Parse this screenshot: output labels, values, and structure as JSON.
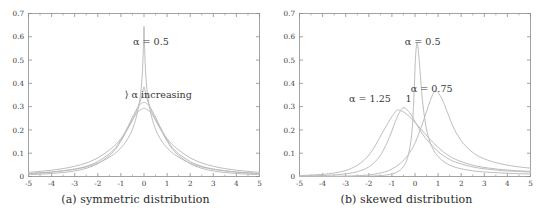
{
  "figure": {
    "background": "#ffffff",
    "curve_color": "#b9b9b9",
    "axis_color": "#8c8c8c",
    "text_color": "#3a3a3a"
  },
  "panels": [
    {
      "id": "a",
      "caption": "(a) symmetric distribution",
      "annotations": [
        {
          "name": "alpha-half-label",
          "text": "α = 0.5",
          "x": 0.3,
          "y": 0.565
        },
        {
          "name": "alpha-increasing-label",
          "text": "⟩ α increasing",
          "x": 0.62,
          "y": 0.335
        }
      ]
    },
    {
      "id": "b",
      "caption": "(b) skewed distribution",
      "annotations": [
        {
          "name": "alpha-0-5-label",
          "text": "α = 0.5",
          "x": 0.33,
          "y": 0.565
        },
        {
          "name": "alpha-0-75-label",
          "text": "α = 0.75",
          "x": 0.72,
          "y": 0.365
        },
        {
          "name": "alpha-1-25-label",
          "text": "α = 1.25",
          "x": -1.95,
          "y": 0.318
        },
        {
          "name": "alpha-1-label",
          "text": "1",
          "x": -0.28,
          "y": 0.318
        }
      ]
    }
  ],
  "chart_data": [
    {
      "type": "line",
      "panel": "a",
      "title": "(a) symmetric distribution",
      "xlabel": "",
      "ylabel": "",
      "xlim": [
        -5,
        5
      ],
      "ylim": [
        0,
        0.7
      ],
      "xticks": [
        -5,
        -4,
        -3,
        -2,
        -1,
        0,
        1,
        2,
        3,
        4,
        5
      ],
      "yticks": [
        0,
        0.1,
        0.2,
        0.3,
        0.4,
        0.5,
        0.6,
        0.7
      ],
      "grid": false,
      "legend": "none",
      "annotations": [
        "α = 0.5",
        "α increasing"
      ],
      "series": [
        {
          "name": "alpha = 0.5",
          "alpha": 0.5,
          "beta": 0,
          "peak_x": 0,
          "peak_y": 0.645,
          "x": [
            -5,
            -4.5,
            -4,
            -3.5,
            -3,
            -2.5,
            -2,
            -1.5,
            -1.2,
            -1,
            -0.8,
            -0.6,
            -0.45,
            -0.3,
            -0.2,
            -0.12,
            -0.06,
            -0.02,
            0,
            0.02,
            0.06,
            0.12,
            0.2,
            0.3,
            0.45,
            0.6,
            0.8,
            1,
            1.2,
            1.5,
            2,
            2.5,
            3,
            3.5,
            4,
            4.5,
            5
          ],
          "y": [
            0.013,
            0.016,
            0.019,
            0.024,
            0.031,
            0.041,
            0.057,
            0.083,
            0.104,
            0.123,
            0.147,
            0.181,
            0.216,
            0.268,
            0.318,
            0.379,
            0.465,
            0.575,
            0.645,
            0.575,
            0.465,
            0.379,
            0.318,
            0.268,
            0.216,
            0.181,
            0.147,
            0.123,
            0.104,
            0.083,
            0.057,
            0.041,
            0.031,
            0.024,
            0.019,
            0.016,
            0.013
          ]
        },
        {
          "name": "alpha = 0.75",
          "alpha": 0.75,
          "beta": 0,
          "peak_x": 0,
          "peak_y": 0.385,
          "x": [
            -5,
            -4.5,
            -4,
            -3.5,
            -3,
            -2.5,
            -2,
            -1.5,
            -1.2,
            -1,
            -0.8,
            -0.6,
            -0.45,
            -0.3,
            -0.2,
            -0.12,
            -0.06,
            -0.02,
            0,
            0.02,
            0.06,
            0.12,
            0.2,
            0.3,
            0.45,
            0.6,
            0.8,
            1,
            1.2,
            1.5,
            2,
            2.5,
            3,
            3.5,
            4,
            4.5,
            5
          ],
          "y": [
            0.018,
            0.022,
            0.027,
            0.034,
            0.044,
            0.058,
            0.08,
            0.114,
            0.14,
            0.163,
            0.19,
            0.223,
            0.252,
            0.288,
            0.313,
            0.337,
            0.362,
            0.38,
            0.385,
            0.38,
            0.362,
            0.337,
            0.313,
            0.288,
            0.252,
            0.223,
            0.19,
            0.163,
            0.14,
            0.114,
            0.08,
            0.058,
            0.044,
            0.034,
            0.027,
            0.022,
            0.018
          ]
        },
        {
          "name": "alpha = 1.0",
          "alpha": 1.0,
          "beta": 0,
          "peak_x": 0,
          "peak_y": 0.318,
          "x": [
            -5,
            -4.5,
            -4,
            -3.5,
            -3,
            -2.5,
            -2,
            -1.5,
            -1.2,
            -1,
            -0.8,
            -0.6,
            -0.45,
            -0.3,
            -0.2,
            -0.12,
            -0.06,
            -0.02,
            0,
            0.02,
            0.06,
            0.12,
            0.2,
            0.3,
            0.45,
            0.6,
            0.8,
            1,
            1.2,
            1.5,
            2,
            2.5,
            3,
            3.5,
            4,
            4.5,
            5
          ],
          "y": [
            0.012,
            0.015,
            0.019,
            0.025,
            0.032,
            0.044,
            0.064,
            0.098,
            0.127,
            0.159,
            0.194,
            0.234,
            0.265,
            0.292,
            0.306,
            0.313,
            0.317,
            0.318,
            0.318,
            0.318,
            0.317,
            0.313,
            0.306,
            0.292,
            0.265,
            0.234,
            0.194,
            0.159,
            0.127,
            0.098,
            0.064,
            0.044,
            0.032,
            0.025,
            0.019,
            0.015,
            0.012
          ]
        },
        {
          "name": "alpha = 1.25",
          "alpha": 1.25,
          "beta": 0,
          "peak_x": 0,
          "peak_y": 0.293,
          "x": [
            -5,
            -4.5,
            -4,
            -3.5,
            -3,
            -2.5,
            -2,
            -1.5,
            -1.2,
            -1,
            -0.8,
            -0.6,
            -0.45,
            -0.3,
            -0.2,
            -0.12,
            -0.06,
            -0.02,
            0,
            0.02,
            0.06,
            0.12,
            0.2,
            0.3,
            0.45,
            0.6,
            0.8,
            1,
            1.2,
            1.5,
            2,
            2.5,
            3,
            3.5,
            4,
            4.5,
            5
          ],
          "y": [
            0.008,
            0.01,
            0.013,
            0.017,
            0.024,
            0.035,
            0.055,
            0.09,
            0.122,
            0.152,
            0.188,
            0.225,
            0.252,
            0.274,
            0.283,
            0.288,
            0.291,
            0.293,
            0.293,
            0.293,
            0.291,
            0.288,
            0.283,
            0.274,
            0.252,
            0.225,
            0.188,
            0.152,
            0.122,
            0.09,
            0.055,
            0.035,
            0.024,
            0.017,
            0.013,
            0.01,
            0.008
          ]
        }
      ]
    },
    {
      "type": "line",
      "panel": "b",
      "title": "(b) skewed distribution",
      "xlabel": "",
      "ylabel": "",
      "xlim": [
        -5,
        5
      ],
      "ylim": [
        0,
        0.7
      ],
      "xticks": [
        -5,
        -4,
        -3,
        -2,
        -1,
        0,
        1,
        2,
        3,
        4,
        5
      ],
      "yticks": [
        0,
        0.1,
        0.2,
        0.3,
        0.4,
        0.5,
        0.6,
        0.7
      ],
      "grid": false,
      "legend": "none",
      "annotations": [
        "α = 0.5",
        "α = 0.75",
        "α = 1.25",
        "1"
      ],
      "series": [
        {
          "name": "alpha = 0.5",
          "alpha": 0.5,
          "beta": 1,
          "peak_x": 0.08,
          "peak_y": 0.572,
          "x": [
            -5,
            -4,
            -3,
            -2.5,
            -2,
            -1.5,
            -1.2,
            -1,
            -0.8,
            -0.6,
            -0.4,
            -0.25,
            -0.12,
            -0.04,
            0.02,
            0.08,
            0.14,
            0.22,
            0.32,
            0.45,
            0.6,
            0.8,
            1,
            1.3,
            1.7,
            2.2,
            2.8,
            3.4,
            4,
            4.5,
            5
          ],
          "y": [
            0.0,
            0.0,
            0.0,
            0.0005,
            0.0015,
            0.004,
            0.007,
            0.011,
            0.018,
            0.031,
            0.06,
            0.11,
            0.205,
            0.36,
            0.505,
            0.572,
            0.545,
            0.45,
            0.33,
            0.23,
            0.163,
            0.114,
            0.086,
            0.06,
            0.041,
            0.029,
            0.021,
            0.017,
            0.014,
            0.012,
            0.011
          ]
        },
        {
          "name": "alpha = 0.75",
          "alpha": 0.75,
          "beta": 1,
          "peak_x": 0.85,
          "peak_y": 0.365,
          "x": [
            -5,
            -4,
            -3.2,
            -2.6,
            -2.1,
            -1.7,
            -1.3,
            -1,
            -0.7,
            -0.4,
            -0.1,
            0.15,
            0.35,
            0.52,
            0.68,
            0.85,
            1,
            1.18,
            1.4,
            1.7,
            2.1,
            2.6,
            3.1,
            3.6,
            4.1,
            4.6,
            5
          ],
          "y": [
            0.0,
            0.0005,
            0.0015,
            0.003,
            0.006,
            0.011,
            0.02,
            0.032,
            0.051,
            0.08,
            0.123,
            0.18,
            0.235,
            0.285,
            0.332,
            0.365,
            0.36,
            0.33,
            0.276,
            0.203,
            0.141,
            0.096,
            0.072,
            0.057,
            0.047,
            0.04,
            0.036
          ]
        },
        {
          "name": "alpha = 1.0",
          "alpha": 1.0,
          "beta": 1,
          "peak_x": -0.52,
          "peak_y": 0.295,
          "x": [
            -5,
            -4.4,
            -3.8,
            -3.2,
            -2.7,
            -2.3,
            -2,
            -1.7,
            -1.45,
            -1.2,
            -1,
            -0.85,
            -0.7,
            -0.6,
            -0.52,
            -0.42,
            -0.3,
            -0.15,
            0.05,
            0.3,
            0.6,
            1,
            1.5,
            2,
            2.6,
            3.2,
            3.8,
            4.4,
            5
          ],
          "y": [
            0.002,
            0.003,
            0.005,
            0.009,
            0.016,
            0.027,
            0.041,
            0.066,
            0.099,
            0.147,
            0.196,
            0.236,
            0.27,
            0.287,
            0.295,
            0.293,
            0.283,
            0.262,
            0.228,
            0.186,
            0.148,
            0.107,
            0.073,
            0.054,
            0.039,
            0.031,
            0.025,
            0.022,
            0.019
          ]
        },
        {
          "name": "alpha = 1.25",
          "alpha": 1.25,
          "beta": 1,
          "peak_x": -0.78,
          "peak_y": 0.285,
          "x": [
            -5,
            -4.5,
            -4,
            -3.5,
            -3.1,
            -2.8,
            -2.5,
            -2.2,
            -1.95,
            -1.7,
            -1.45,
            -1.25,
            -1.05,
            -0.9,
            -0.78,
            -0.65,
            -0.5,
            -0.3,
            -0.05,
            0.25,
            0.6,
            1,
            1.5,
            2,
            2.6,
            3.2,
            3.8,
            4.4,
            5
          ],
          "y": [
            0.004,
            0.006,
            0.009,
            0.015,
            0.023,
            0.033,
            0.048,
            0.07,
            0.098,
            0.136,
            0.181,
            0.216,
            0.25,
            0.271,
            0.285,
            0.284,
            0.277,
            0.262,
            0.238,
            0.204,
            0.165,
            0.125,
            0.087,
            0.064,
            0.046,
            0.036,
            0.029,
            0.025,
            0.022
          ]
        }
      ]
    }
  ]
}
